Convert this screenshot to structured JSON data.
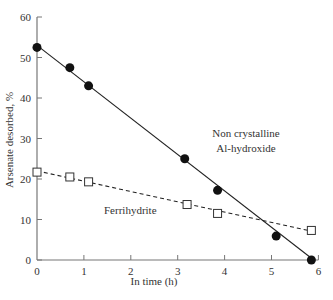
{
  "chart_data": {
    "type": "line",
    "title": "",
    "xlabel": "In time (h)",
    "ylabel": "Arsenate desorbed, %",
    "xlim": [
      0,
      6
    ],
    "ylim": [
      0,
      60
    ],
    "x_ticks": [
      "0",
      "1",
      "2",
      "3",
      "4",
      "5",
      "6"
    ],
    "y_ticks": [
      "0",
      "10",
      "20",
      "30",
      "40",
      "50",
      "60"
    ],
    "grid": false,
    "legend": "inline annotations",
    "series": [
      {
        "name": "Non crystalline Al-hydroxide",
        "label_lines": [
          "Non crystalline",
          "Al-hydroxide"
        ],
        "marker": "filled-circle",
        "line_style": "solid",
        "points": [
          {
            "x": 0.0,
            "y": 52.5
          },
          {
            "x": 0.7,
            "y": 47.5
          },
          {
            "x": 1.1,
            "y": 43.0
          },
          {
            "x": 3.15,
            "y": 25.0
          },
          {
            "x": 3.85,
            "y": 17.2
          },
          {
            "x": 5.1,
            "y": 5.9
          },
          {
            "x": 5.85,
            "y": 0.0
          }
        ],
        "fit_line": [
          {
            "x": 0.0,
            "y": 53.0
          },
          {
            "x": 5.9,
            "y": 0.0
          }
        ]
      },
      {
        "name": "Ferrihydrite",
        "label_lines": [
          "Ferrihydrite"
        ],
        "marker": "open-square",
        "line_style": "dashed",
        "points": [
          {
            "x": 0.0,
            "y": 21.7
          },
          {
            "x": 0.7,
            "y": 20.5
          },
          {
            "x": 1.1,
            "y": 19.3
          },
          {
            "x": 3.2,
            "y": 13.7
          },
          {
            "x": 3.85,
            "y": 11.5
          },
          {
            "x": 5.85,
            "y": 7.3
          }
        ],
        "fit_line": [
          {
            "x": 0.0,
            "y": 22.0
          },
          {
            "x": 5.9,
            "y": 7.0
          }
        ]
      }
    ]
  }
}
